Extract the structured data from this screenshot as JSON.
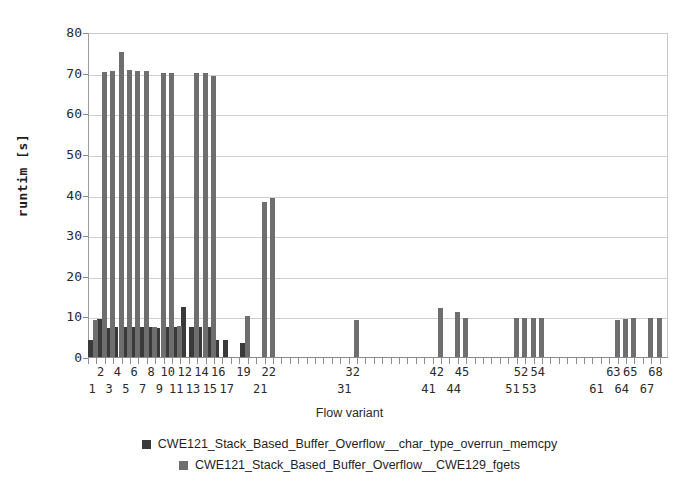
{
  "axes": {
    "ylabel": "runtim [s]",
    "xlabel": "Flow variant",
    "yticks": [
      "0",
      "10",
      "20",
      "30",
      "40",
      "50",
      "60",
      "70",
      "80"
    ]
  },
  "legend": {
    "items": [
      {
        "label": "CWE121_Stack_Based_Buffer_Overflow__char_type_overrun_memcpy",
        "color": "#3a3a3a",
        "swatch": "square-swatch"
      },
      {
        "label": "CWE121_Stack_Based_Buffer_Overflow__CWE129_fgets",
        "color": "#6e6e6e",
        "swatch": "square-swatch"
      }
    ]
  },
  "chart_data": {
    "type": "bar",
    "title": "",
    "xlabel": "Flow variant",
    "ylabel": "runtim [s]",
    "ylim": [
      0,
      80
    ],
    "ytick_step": 10,
    "grid": true,
    "legend_position": "bottom",
    "categories": [
      "1",
      "2",
      "3",
      "4",
      "5",
      "6",
      "7",
      "8",
      "9",
      "10",
      "11",
      "12",
      "13",
      "14",
      "15",
      "16",
      "17",
      "19",
      "21",
      "22",
      "31",
      "32",
      "41",
      "42",
      "44",
      "45",
      "51",
      "52",
      "53",
      "54",
      "61",
      "63",
      "64",
      "65",
      "67",
      "68"
    ],
    "series": [
      {
        "name": "CWE121_Stack_Based_Buffer_Overflow__char_type_overrun_memcpy",
        "color": "#3a3a3a",
        "values": [
          4.2,
          9.3,
          7.2,
          7.3,
          7.3,
          7.4,
          7.3,
          7.3,
          7.2,
          7.4,
          7.3,
          12.2,
          7.3,
          7.3,
          7.3,
          4.1,
          4.1,
          3.4,
          0,
          0,
          0,
          0,
          0,
          0,
          0,
          0,
          0,
          0,
          0,
          0,
          0,
          0,
          0,
          0,
          0,
          0
        ]
      },
      {
        "name": "CWE121_Stack_Based_Buffer_Overflow__CWE129_fgets",
        "color": "#6e6e6e",
        "values": [
          9.1,
          70.2,
          70.3,
          75.0,
          70.6,
          70.4,
          70.3,
          7.4,
          70.0,
          69.9,
          7.7,
          0,
          69.8,
          69.9,
          69.2,
          0,
          0,
          10.2,
          38.1,
          39.2,
          0,
          9.2,
          0,
          12.1,
          11.2,
          9.6,
          9.6,
          9.7,
          9.7,
          9.6,
          0,
          9.2,
          9.4,
          9.6,
          9.5,
          9.6
        ]
      }
    ]
  }
}
